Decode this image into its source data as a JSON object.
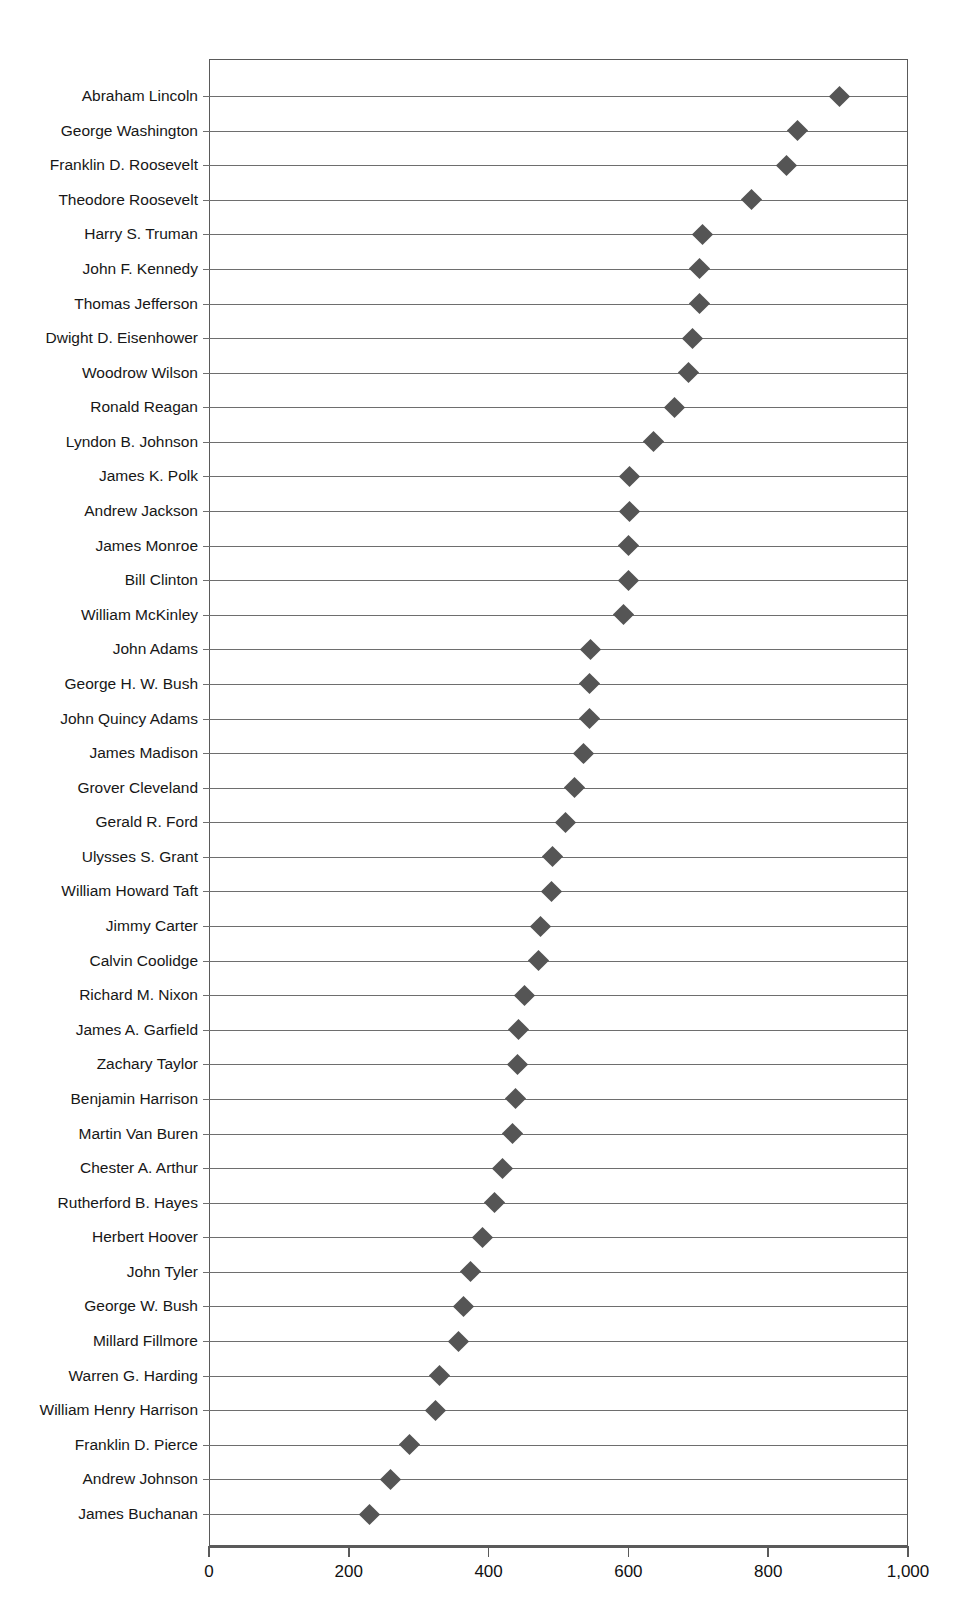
{
  "chart_data": {
    "type": "scatter",
    "plot_style": "dot-plot",
    "title": "",
    "subtitle": "",
    "xlabel": "",
    "ylabel": "",
    "xlim": [
      0,
      1000
    ],
    "xticks": [
      0,
      200,
      400,
      600,
      800,
      1000
    ],
    "xtick_labels": [
      "0",
      "200",
      "400",
      "600",
      "800",
      "1,000"
    ],
    "grid": "horizontal-row-lines",
    "legend": "none",
    "marker": {
      "shape": "diamond",
      "color": "#555555",
      "size": 15
    },
    "orientation": "horizontal",
    "sorted": "descending",
    "categories": [
      "Abraham Lincoln",
      "George Washington",
      "Franklin D. Roosevelt",
      "Theodore Roosevelt",
      "Harry S. Truman",
      "John F. Kennedy",
      "Thomas Jefferson",
      "Dwight D. Eisenhower",
      "Woodrow Wilson",
      "Ronald Reagan",
      "Lyndon B. Johnson",
      "James K. Polk",
      "Andrew Jackson",
      "James Monroe",
      "Bill Clinton",
      "William McKinley",
      "John Adams",
      "George H. W. Bush",
      "John Quincy Adams",
      "James Madison",
      "Grover Cleveland",
      "Gerald R. Ford",
      "Ulysses S. Grant",
      "William Howard Taft",
      "Jimmy Carter",
      "Calvin Coolidge",
      "Richard M. Nixon",
      "James A. Garfield",
      "Zachary Taylor",
      "Benjamin Harrison",
      "Martin Van Buren",
      "Chester A. Arthur",
      "Rutherford B. Hayes",
      "Herbert Hoover",
      "John Tyler",
      "George W. Bush",
      "Millard Fillmore",
      "Warren G. Harding",
      "William Henry Harrison",
      "Franklin D. Pierce",
      "Andrew Johnson",
      "James Buchanan"
    ],
    "values": [
      900,
      840,
      825,
      775,
      705,
      700,
      700,
      690,
      685,
      665,
      635,
      600,
      600,
      598,
      598,
      592,
      545,
      543,
      543,
      535,
      522,
      508,
      490,
      488,
      473,
      470,
      450,
      442,
      440,
      437,
      433,
      418,
      407,
      390,
      372,
      363,
      355,
      328,
      322,
      285,
      258,
      228
    ]
  }
}
